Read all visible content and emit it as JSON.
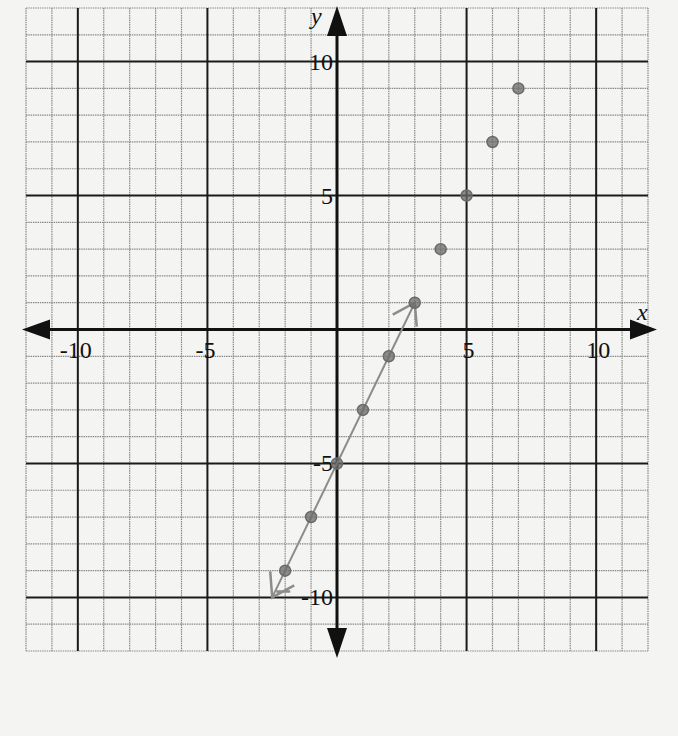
{
  "chart_data": {
    "type": "scatter",
    "title": "",
    "xlabel": "x",
    "ylabel": "y",
    "xlim": [
      -12,
      12
    ],
    "ylim": [
      -12,
      12
    ],
    "grid": true,
    "major_ticks": [
      -10,
      -5,
      5,
      10
    ],
    "x_tick_labels": [
      "-10",
      "-5",
      "5",
      "10"
    ],
    "y_tick_labels": [
      "10",
      "5",
      "-5",
      "-10"
    ],
    "series": [
      {
        "name": "plotted points",
        "x": [
          -2,
          -1,
          0,
          1,
          2,
          3,
          4,
          5,
          6,
          7
        ],
        "y": [
          -9,
          -7,
          -5,
          -3,
          -1,
          1,
          3,
          5,
          7,
          9
        ]
      }
    ],
    "drawn_line": {
      "description": "pencil line through points, slope 2, y-intercept -5",
      "from": [
        -2.5,
        -10
      ],
      "to": [
        3,
        1
      ]
    },
    "colors": {
      "grid_minor": "#8a8a8a",
      "grid_major": "#1a1a1a",
      "axis": "#111111",
      "points": "#6a6a6a",
      "pencil": "#8c8c8c",
      "paper": "#f4f4f2"
    }
  }
}
